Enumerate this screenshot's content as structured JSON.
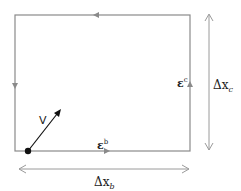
{
  "diagram": {
    "type": "rectangular circulation loop",
    "colors": {
      "loop": "#8a8a8a",
      "dimension": "#9a9a9a",
      "vector": "#111111",
      "text": "#222222"
    },
    "loop": {
      "direction": "counter-clockwise",
      "edges": [
        {
          "side": "bottom",
          "arrow": "right",
          "label": "ε",
          "superscript": "b"
        },
        {
          "side": "right",
          "arrow": "up",
          "label": "ε",
          "superscript": "c"
        },
        {
          "side": "top",
          "arrow": "left",
          "label": ""
        },
        {
          "side": "left",
          "arrow": "down",
          "label": ""
        }
      ]
    },
    "vector": {
      "label": "V",
      "origin": "bottom-left corner"
    },
    "dimensions": {
      "horizontal": {
        "label": "Δx",
        "subscript": "b"
      },
      "vertical": {
        "label": "Δx",
        "subscript": "c"
      }
    }
  }
}
